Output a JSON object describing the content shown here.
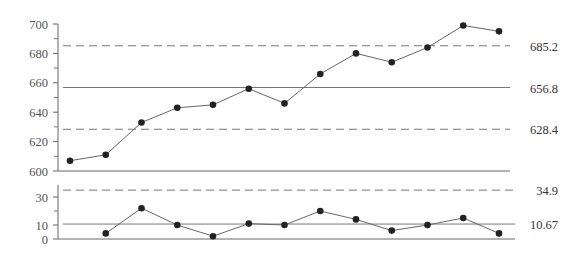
{
  "chart_data": [
    {
      "type": "line",
      "title": "Individuals (I) chart",
      "xlabel": "",
      "ylabel": "",
      "ylim": [
        600,
        700
      ],
      "yticks": [
        600,
        620,
        640,
        660,
        680,
        700
      ],
      "ytick_labels": [
        "600",
        "620",
        "640",
        "660",
        "680",
        "700"
      ],
      "x": [
        1,
        2,
        3,
        4,
        5,
        6,
        7,
        8,
        9,
        10,
        11,
        12,
        13
      ],
      "series": [
        {
          "name": "Individual value",
          "values": [
            607,
            611,
            633,
            643,
            645,
            656,
            646,
            666,
            680,
            674,
            684,
            699,
            695
          ]
        }
      ],
      "reference_lines": [
        {
          "name": "UCL",
          "value": 685.2,
          "label": "685.2",
          "style": "dashed"
        },
        {
          "name": "CL",
          "value": 656.8,
          "label": "656.8",
          "style": "solid"
        },
        {
          "name": "LCL",
          "value": 628.4,
          "label": "628.4",
          "style": "dashed"
        }
      ],
      "grid": false,
      "legend": "none"
    },
    {
      "type": "line",
      "title": "Moving Range (MR) chart",
      "xlabel": "",
      "ylabel": "",
      "ylim": [
        0,
        40
      ],
      "yticks": [
        0,
        10,
        30
      ],
      "ytick_labels": [
        "0",
        "10",
        "30"
      ],
      "x": [
        2,
        3,
        4,
        5,
        6,
        7,
        8,
        9,
        10,
        11,
        12,
        13
      ],
      "series": [
        {
          "name": "Moving range",
          "values": [
            4,
            22,
            10,
            2,
            11,
            10,
            20,
            14,
            6,
            10,
            15,
            4
          ]
        }
      ],
      "reference_lines": [
        {
          "name": "UCL",
          "value": 34.9,
          "label": "34.9",
          "style": "dashed"
        },
        {
          "name": "CL",
          "value": 10.67,
          "label": "10.67",
          "style": "solid"
        }
      ],
      "grid": false,
      "legend": "none"
    }
  ]
}
